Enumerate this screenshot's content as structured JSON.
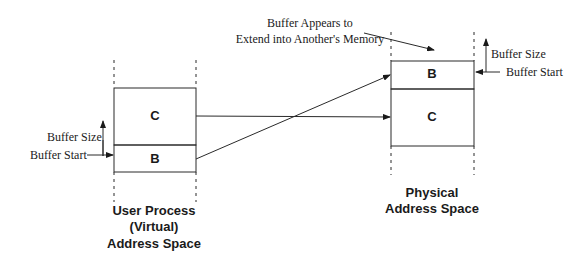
{
  "annotation": {
    "line1": "Buffer Appears to",
    "line2": "Extend into Another's Memory"
  },
  "virtual_space": {
    "title_line1": "User Process",
    "title_line2": "(Virtual)",
    "title_line3": "Address Space",
    "segments": [
      {
        "label": "C"
      },
      {
        "label": "B"
      }
    ],
    "buffer_size_label": "Buffer Size",
    "buffer_start_label": "Buffer Start"
  },
  "physical_space": {
    "title_line1": "Physical",
    "title_line2": "Address Space",
    "segments": [
      {
        "label": "B"
      },
      {
        "label": "C"
      }
    ],
    "buffer_size_label": "Buffer Size",
    "buffer_start_label": "Buffer Start"
  },
  "colors": {
    "ink": "#1a1a1a",
    "background": "#ffffff"
  }
}
